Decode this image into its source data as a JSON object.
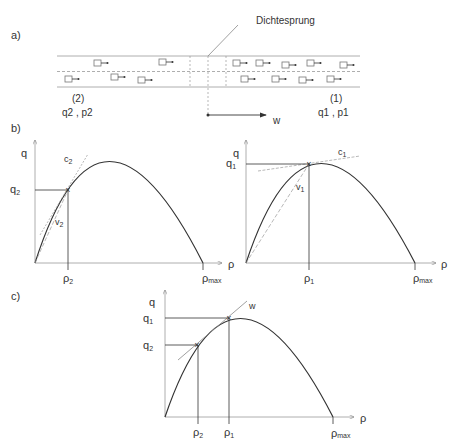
{
  "panels": {
    "a": {
      "label": "a)",
      "annotation": "Dichtesprung",
      "wave_label": "w",
      "upstream": {
        "index": "(2)",
        "values": "q2 , p2"
      },
      "downstream": {
        "index": "(1)",
        "values": "q1 , p1"
      }
    },
    "b": {
      "label": "b)",
      "left": {
        "y_axis": "q",
        "x_axis": "ρ",
        "q_label": "q",
        "q_sub": "2",
        "rho_label": "ρ",
        "rho_sub": "2",
        "rhomax": "ρ",
        "rhomax_sub": "max",
        "c_label": "c",
        "c_sub": "2",
        "v_label": "v",
        "v_sub": "2"
      },
      "right": {
        "y_axis": "q",
        "x_axis": "ρ",
        "q_label": "q",
        "q_sub": "1",
        "rho_label": "ρ",
        "rho_sub": "1",
        "rhomax": "ρ",
        "rhomax_sub": "max",
        "c_label": "c",
        "c_sub": "1",
        "v_label": "v",
        "v_sub": "1"
      }
    },
    "c": {
      "label": "c)",
      "y_axis": "q",
      "x_axis": "ρ",
      "q1": "q",
      "q1_sub": "1",
      "q2": "q",
      "q2_sub": "2",
      "rho1": "ρ",
      "rho1_sub": "1",
      "rho2": "ρ",
      "rho2_sub": "2",
      "rhomax": "ρ",
      "rhomax_sub": "max",
      "w_label": "w"
    }
  },
  "colors": {
    "line": "#333333",
    "guide": "#888888",
    "road": "#999999"
  }
}
